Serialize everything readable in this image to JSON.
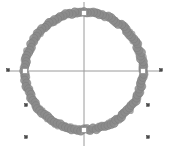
{
  "figure": {
    "title": "",
    "background_color": "#ffffff",
    "width": 169,
    "height": 148
  },
  "chart_data": {
    "type": "scatter",
    "title": "",
    "xlabel": "",
    "ylabel": "",
    "grid": false,
    "legend": null,
    "axis_style": {
      "color": "#9a9a9a",
      "line_width": 1,
      "x_axis_y_pixel": 71,
      "y_axis_x_pixel": 84,
      "x_axis_extent_pixels": [
        8,
        160
      ],
      "y_axis_extent_pixels": [
        2,
        146
      ]
    },
    "center_pixel": [
      84,
      71
    ],
    "xlim": [
      -1.35,
      1.35
    ],
    "ylim": [
      -1.3,
      1.3
    ],
    "series": [
      {
        "name": "ring",
        "marker": "circle",
        "marker_color": "#8c8c8c",
        "marker_edge_color": "#7a7a7a",
        "marker_size": 4.2,
        "description": "dense ring of overlapping gray markers forming a thick circle",
        "radius_data": 1.0,
        "radius_pixels": 59,
        "point_count": 120,
        "radial_jitter": 0.022
      },
      {
        "name": "axis-crossings",
        "marker": "square",
        "marker_color": "#ffffff",
        "marker_edge_color": "#8c8c8c",
        "marker_size": 5,
        "description": "white square markers where axes intersect the ring",
        "points": [
          {
            "x": -1.0,
            "y": 0.0,
            "px": 25,
            "py": 71
          },
          {
            "x": 1.0,
            "y": 0.0,
            "px": 143,
            "py": 71
          },
          {
            "x": 0.0,
            "y": 1.0,
            "px": 84,
            "py": 13
          },
          {
            "x": 0.0,
            "y": -1.0,
            "px": 84,
            "py": 130
          }
        ]
      },
      {
        "name": "outliers",
        "marker": "square",
        "marker_color": "#4a4a4a",
        "marker_edge_color": "#333333",
        "marker_size": 2.6,
        "description": "isolated dark markers outside the ring",
        "points": [
          {
            "x": -1.29,
            "y": 0.0,
            "px": 8,
            "py": 70
          },
          {
            "x": 1.29,
            "y": 0.0,
            "px": 161,
            "py": 70
          },
          {
            "x": -1.07,
            "y": -0.59,
            "px": 26,
            "py": 105
          },
          {
            "x": 1.09,
            "y": -0.59,
            "px": 148,
            "py": 105
          },
          {
            "x": -1.07,
            "y": -1.09,
            "px": 26,
            "py": 137
          },
          {
            "x": 1.09,
            "y": -1.09,
            "px": 148,
            "py": 137
          }
        ]
      }
    ]
  }
}
